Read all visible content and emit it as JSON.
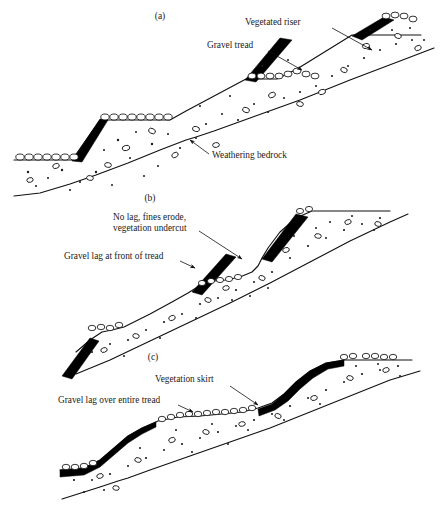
{
  "figure": {
    "background": "#ffffff",
    "ink": "#111111",
    "vegetation_color": "#000000"
  },
  "panels": [
    {
      "id": "a",
      "label": "(a)",
      "label_x": 160,
      "label_y": 19,
      "description": "Fresh terrace staircase with sharp vegetated risers and gravel-mantled treads over weathering bedrock",
      "annotations": [
        {
          "name": "vegetated-riser",
          "text": "Vegetated riser",
          "text_x": 245,
          "text_y": 25,
          "anchor": "start",
          "leader": "M 332 28 L 372 49",
          "arrow_x": 375,
          "arrow_y": 51,
          "arrow_rot": 28
        },
        {
          "name": "gravel-tread",
          "text": "Gravel tread",
          "text_x": 207,
          "text_y": 48,
          "anchor": "start",
          "leader": "M 272 51 L 303 69",
          "arrow_x": 306,
          "arrow_y": 71,
          "arrow_rot": 30
        },
        {
          "name": "weathering-bedrock",
          "text": "Weathering bedrock",
          "text_x": 212,
          "text_y": 157,
          "anchor": "start",
          "leader": "M 210 154 L 190 140",
          "arrow_x": 188,
          "arrow_y": 138,
          "arrow_rot": 215
        }
      ]
    },
    {
      "id": "b",
      "label": "(b)",
      "label_x": 150,
      "label_y": 201,
      "description": "Degraded terraces: fines eroded, vegetation undercut, gravel lag only at front of tread",
      "annotations": [
        {
          "name": "no-lag-fines-erode",
          "text_lines": [
            "No lag, fines erode,",
            "vegetation undercut"
          ],
          "text_x": 113,
          "text_y": 220,
          "anchor": "start",
          "leader": "M 201 235 L 243 259",
          "arrow_x": 246,
          "arrow_y": 261,
          "arrow_rot": 30
        },
        {
          "name": "gravel-lag-front-of-tread",
          "text": "Gravel lag at front of tread",
          "text_x": 64,
          "text_y": 259,
          "anchor": "start",
          "leader": "M 182 261 L 196 268",
          "arrow_x": 199,
          "arrow_y": 269,
          "arrow_rot": 25
        }
      ]
    },
    {
      "id": "c",
      "label": "(c)",
      "label_x": 153,
      "label_y": 360,
      "description": "Smoothed terraces with continuous gravel lag over entire tread and vegetation skirt on riser",
      "annotations": [
        {
          "name": "vegetation-skirt",
          "text": "Vegetation skirt",
          "text_x": 155,
          "text_y": 382,
          "anchor": "start",
          "leader": "M 232 386 L 258 404",
          "arrow_x": 261,
          "arrow_y": 406,
          "arrow_rot": 33
        },
        {
          "name": "gravel-lag-entire-tread",
          "text": "Gravel lag over entire tread",
          "text_x": 58,
          "text_y": 403,
          "anchor": "start",
          "leader": "M 180 405 L 194 412",
          "arrow_x": 197,
          "arrow_y": 413,
          "arrow_rot": 25
        }
      ]
    }
  ],
  "legend_semantics": {
    "black_wedge": "vegetated riser / vegetation skirt",
    "open_circles_on_surface": "gravel lag clasts",
    "stipple_dots": "fine-grained colluvium / soil fill",
    "lower_solid_line": "weathering bedrock contact"
  }
}
